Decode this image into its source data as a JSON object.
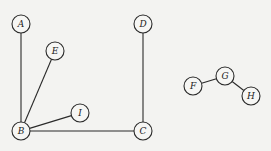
{
  "graph": {
    "nodes": [
      {
        "id": "A",
        "label": "A",
        "x": 21,
        "y": 24
      },
      {
        "id": "E",
        "label": "E",
        "x": 55,
        "y": 51
      },
      {
        "id": "D",
        "label": "D",
        "x": 143,
        "y": 24
      },
      {
        "id": "B",
        "label": "B",
        "x": 21,
        "y": 131
      },
      {
        "id": "I",
        "label": "I",
        "x": 80,
        "y": 113
      },
      {
        "id": "C",
        "label": "C",
        "x": 143,
        "y": 131
      },
      {
        "id": "F",
        "label": "F",
        "x": 193,
        "y": 86
      },
      {
        "id": "G",
        "label": "G",
        "x": 225,
        "y": 76
      },
      {
        "id": "H",
        "label": "H",
        "x": 251,
        "y": 96
      }
    ],
    "edges": [
      [
        "A",
        "B"
      ],
      [
        "E",
        "B"
      ],
      [
        "I",
        "B"
      ],
      [
        "B",
        "C"
      ],
      [
        "D",
        "C"
      ],
      [
        "F",
        "G"
      ],
      [
        "G",
        "H"
      ]
    ],
    "node_radius": 9
  }
}
